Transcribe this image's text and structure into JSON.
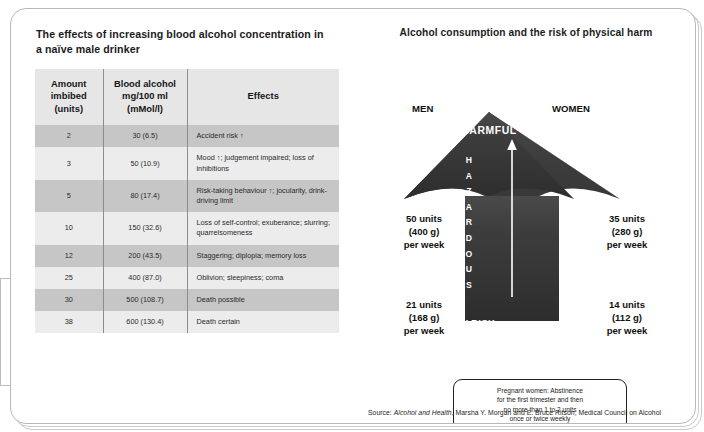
{
  "left_panel": {
    "title": "The effects of increasing blood alcohol concentration in a naïve male drinker",
    "table": {
      "headers": {
        "amount": "Amount imbibed (units)",
        "amount_l1": "Amount",
        "amount_l2": "imbibed",
        "amount_l3": "(units)",
        "bac_l1": "Blood alcohol",
        "bac_l2": "mg/100 ml",
        "bac_l3": "(mMol/l)",
        "effects": "Effects"
      },
      "rows": [
        {
          "amount": "2",
          "bac": "30 (6.5)",
          "effects": "Accident risk ↑"
        },
        {
          "amount": "3",
          "bac": "50 (10.9)",
          "effects": "Mood ↑; judgement impaired; loss of inhibitions"
        },
        {
          "amount": "5",
          "bac": "80 (17.4)",
          "effects": "Risk-taking behaviour ↑; jocularity, drink-driving limit"
        },
        {
          "amount": "10",
          "bac": "150 (32.6)",
          "effects": "Loss of self-control; exuberance; slurring; quarrelsomeness"
        },
        {
          "amount": "12",
          "bac": "200 (43.5)",
          "effects": "Staggering; diplopia; memory loss"
        },
        {
          "amount": "25",
          "bac": "400 (87.0)",
          "effects": "Oblivion; sleepiness; coma"
        },
        {
          "amount": "30",
          "bac": "500 (108.7)",
          "effects": "Death possible"
        },
        {
          "amount": "38",
          "bac": "600 (130.4)",
          "effects": "Death certain"
        }
      ]
    }
  },
  "right_panel": {
    "title": "Alcohol consumption and the risk of physical harm",
    "column_men": "MEN",
    "column_women": "WOMEN",
    "band_harmful": "HARMFUL",
    "band_hazardous": "HAZARDOUS",
    "band_low_risk": "LOW RISK",
    "men_hazardous_l1": "50 units",
    "men_hazardous_l2": "(400 g)",
    "men_hazardous_l3": "per week",
    "men_low_l1": "21 units",
    "men_low_l2": "(168 g)",
    "men_low_l3": "per week",
    "women_hazardous_l1": "35 units",
    "women_hazardous_l2": "(280 g)",
    "women_hazardous_l3": "per week",
    "women_low_l1": "14 units",
    "women_low_l2": "(112 g)",
    "women_low_l3": "per week",
    "pregnancy_l1": "Pregnant women:  Abstinence",
    "pregnancy_l2": "for the first trimester and then",
    "pregnancy_l3": "no more than 1 to 2 units",
    "pregnancy_l4": "once or twice weekly",
    "source_prefix": "Source:",
    "source_italic": "Alcohol and Health",
    "source_rest": ", Marsha Y. Morgan and E. Bruce Ritson, Medical Council on Alcohol"
  },
  "chart_data": {
    "type": "table",
    "title": "The effects of increasing blood alcohol concentration in a naïve male drinker",
    "columns": [
      "Amount imbibed (units)",
      "Blood alcohol mg/100 ml (mMol/l)",
      "Effects"
    ],
    "units": [
      2,
      3,
      5,
      10,
      12,
      25,
      30,
      38
    ],
    "bac_mg_per_100ml": [
      30,
      50,
      80,
      150,
      200,
      400,
      500,
      600
    ],
    "bac_mmol_per_l": [
      6.5,
      10.9,
      17.4,
      32.6,
      43.5,
      87.0,
      108.7,
      130.4
    ],
    "effects": [
      "Accident risk ↑",
      "Mood ↑; judgement impaired; loss of inhibitions",
      "Risk-taking behaviour ↑; jocularity, drink-driving limit",
      "Loss of self-control; exuberance; slurring; quarrelsomeness",
      "Staggering; diplopia; memory loss",
      "Oblivion; sleepiness; coma",
      "Death possible",
      "Death certain"
    ],
    "risk_diagram": {
      "title": "Alcohol consumption and the risk of physical harm",
      "bands": [
        "LOW RISK",
        "HAZARDOUS",
        "HARMFUL"
      ],
      "series": [
        {
          "name": "MEN",
          "low_risk_units": 21,
          "low_risk_grams": 168,
          "hazardous_units": 50,
          "hazardous_grams": 400,
          "period": "per week"
        },
        {
          "name": "WOMEN",
          "low_risk_units": 14,
          "low_risk_grams": 112,
          "hazardous_units": 35,
          "hazardous_grams": 280,
          "period": "per week"
        }
      ]
    },
    "colors": {
      "arrow_fill": "#3a3a3a",
      "header_band": "#e6e6e6",
      "row_band_dark": "#c6c6c6",
      "row_band_light": "#ececec"
    }
  }
}
